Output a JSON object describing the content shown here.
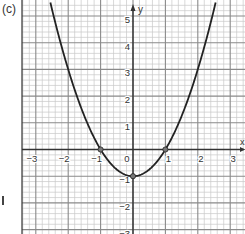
{
  "panel_label": "(c)",
  "colors": {
    "background": "#ffffff",
    "minor_grid": "#c8c8c8",
    "major_grid": "#8a8a8a",
    "axis": "#333333",
    "curve": "#222222",
    "text": "#333333"
  },
  "layout": {
    "origin_px": [
      133,
      149.5
    ],
    "x_unit_px": 32.4,
    "y_unit_px": 26.7,
    "grid_left_px": 22,
    "grid_right_px": 245,
    "grid_top_px": 0,
    "grid_bottom_px": 234,
    "minor_divisions": 5
  },
  "chart_data": {
    "type": "line",
    "title": "(c)",
    "function": "y = x^2 - 1",
    "xlabel": "x",
    "ylabel": "y",
    "xlim": [
      -3.4,
      3.5
    ],
    "ylim": [
      -3.2,
      5.6
    ],
    "grid": true,
    "x_ticks": [
      -3,
      -2,
      -1,
      0,
      1,
      2,
      3
    ],
    "x_tick_labels": [
      "−3",
      "−2",
      "−1",
      "0",
      "1",
      "2",
      "3"
    ],
    "y_ticks": [
      5,
      4,
      3,
      2,
      1,
      -1,
      -2,
      -3
    ],
    "y_tick_labels": [
      "5",
      "4",
      "3",
      "2",
      "1",
      "−1",
      "−2",
      "−3"
    ],
    "series": [
      {
        "name": "parabola",
        "x": [
          -2.55,
          -2.5,
          -2.25,
          -2,
          -1.75,
          -1.5,
          -1.25,
          -1,
          -0.75,
          -0.5,
          -0.25,
          0,
          0.25,
          0.5,
          0.75,
          1,
          1.25,
          1.5,
          1.75,
          2,
          2.25,
          2.5,
          2.55
        ],
        "y": [
          5.5,
          5.25,
          4.06,
          3,
          2.06,
          1.25,
          0.56,
          0,
          -0.44,
          -0.75,
          -0.94,
          -1,
          -0.94,
          -0.75,
          -0.44,
          0,
          0.56,
          1.25,
          2.06,
          3,
          4.06,
          5.25,
          5.5
        ]
      }
    ],
    "marked_points": [
      {
        "x": -1,
        "y": 0,
        "label": "x-intercept"
      },
      {
        "x": 1,
        "y": 0,
        "label": "x-intercept"
      },
      {
        "x": 0,
        "y": -1,
        "label": "vertex"
      }
    ]
  }
}
